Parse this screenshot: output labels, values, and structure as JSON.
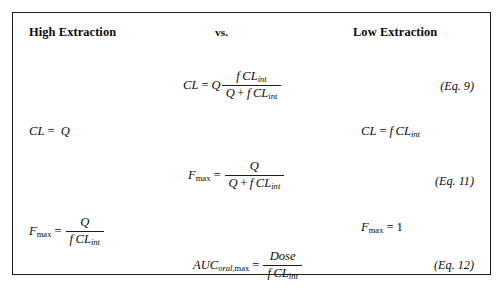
{
  "figure": {
    "header": {
      "left": "High Extraction",
      "middle": "vs.",
      "right": "Low Extraction"
    },
    "equations": {
      "eq9": {
        "lhs": "CL",
        "relation": "=",
        "factor": "Q",
        "numerator_f": "f",
        "numerator_cl": "CL",
        "numerator_sub": "int",
        "denominator_q": "Q",
        "denominator_plus": "+",
        "denominator_f": "f",
        "denominator_cl": "CL",
        "denominator_sub": "int",
        "number": "(Eq. 9)"
      },
      "cl_high": {
        "lhs": "CL",
        "relation": "=",
        "rhs": "Q"
      },
      "cl_low": {
        "lhs": "CL",
        "relation": "=",
        "rhs_f": "f",
        "rhs_cl": "CL",
        "rhs_sub": "int"
      },
      "eq11": {
        "lhs_f": "F",
        "lhs_sub": "max",
        "relation": "=",
        "numerator": "Q",
        "denominator_q": "Q",
        "denominator_plus": "+",
        "denominator_f": "f",
        "denominator_cl": "CL",
        "denominator_sub": "int",
        "number": "(Eq. 11)"
      },
      "fmax_high": {
        "lhs_f": "F",
        "lhs_sub": "max",
        "relation": "=",
        "numerator": "Q",
        "denominator_f": "f",
        "denominator_cl": "CL",
        "denominator_sub": "int"
      },
      "fmax_low": {
        "lhs_f": "F",
        "lhs_sub": "max",
        "relation": "=",
        "rhs": "1"
      },
      "eq12": {
        "lhs_auc": "AUC",
        "lhs_sub_oral": "oral",
        "lhs_sub_comma": ",",
        "lhs_sub_max": "max",
        "relation": "=",
        "numerator": "Dose",
        "denominator_f": "f",
        "denominator_cl": "CL",
        "denominator_sub": "int",
        "number": "(Eq. 12)"
      }
    }
  }
}
